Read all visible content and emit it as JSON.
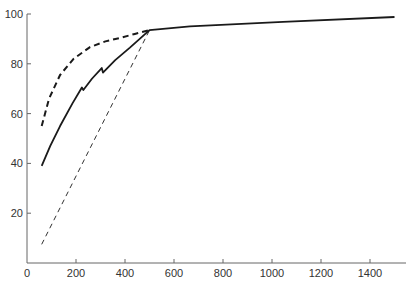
{
  "chart_data": {
    "type": "line",
    "title": "",
    "xlabel": "",
    "ylabel": "",
    "xlim": [
      0,
      1550
    ],
    "ylim": [
      0,
      100
    ],
    "grid": false,
    "legend": null,
    "x_ticks": [
      0,
      200,
      400,
      600,
      800,
      1000,
      1200,
      1400
    ],
    "y_ticks": [
      20,
      40,
      60,
      80,
      100
    ],
    "series": [
      {
        "name": "solid-curve",
        "style": "solid",
        "points": [
          [
            60,
            39
          ],
          [
            95,
            47
          ],
          [
            135,
            55
          ],
          [
            185,
            64
          ],
          [
            224,
            70.5
          ],
          [
            230,
            69.5
          ],
          [
            265,
            74
          ],
          [
            305,
            78.3
          ],
          [
            310,
            76.5
          ],
          [
            360,
            81.5
          ],
          [
            420,
            86.5
          ],
          [
            500,
            93.5
          ],
          [
            665,
            95
          ],
          [
            1045,
            96.8
          ],
          [
            1500,
            98.8
          ]
        ]
      },
      {
        "name": "heavy-dashed-curve",
        "style": "dashed-bold",
        "points": [
          [
            60,
            55
          ],
          [
            90,
            66
          ],
          [
            135,
            75.5
          ],
          [
            190,
            82
          ],
          [
            257,
            86.7
          ],
          [
            320,
            89
          ],
          [
            380,
            90.4
          ],
          [
            440,
            92
          ],
          [
            500,
            93.5
          ]
        ]
      },
      {
        "name": "thin-dashed-line",
        "style": "dashed-thin",
        "points": [
          [
            60,
            7.5
          ],
          [
            500,
            93.5
          ]
        ]
      }
    ]
  },
  "axes": {
    "x_tick_labels": [
      "0",
      "200",
      "400",
      "600",
      "800",
      "1000",
      "1200",
      "1400"
    ],
    "y_tick_labels": [
      "20",
      "40",
      "60",
      "80",
      "100"
    ]
  },
  "colors": {
    "axis": "#666666",
    "line": "#1a1a1a"
  }
}
